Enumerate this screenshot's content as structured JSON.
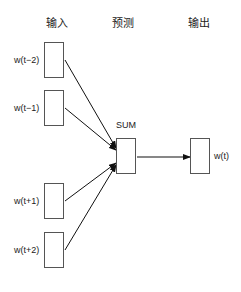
{
  "headers": {
    "input": "输入",
    "predict": "预测",
    "output": "输出"
  },
  "inputs": [
    {
      "label": "w(t−2)"
    },
    {
      "label": "w(t−1)"
    },
    {
      "label": "w(t+1)"
    },
    {
      "label": "w(t+2)"
    }
  ],
  "sum": {
    "label": "SUM"
  },
  "output": {
    "label": "w(t)"
  },
  "colors": {
    "line": "#111111",
    "box_border": "#555555",
    "background": "#ffffff"
  }
}
